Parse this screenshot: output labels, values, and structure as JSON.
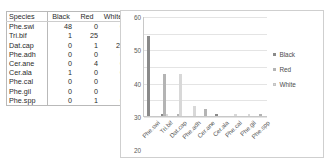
{
  "table": {
    "columns": [
      "Species",
      "Black",
      "Red",
      "White"
    ],
    "rows": [
      {
        "species": "Phe.swi",
        "black": "48",
        "red": "0",
        "white": "0"
      },
      {
        "species": "Tri.bif",
        "black": "1",
        "red": "25",
        "white": "1"
      },
      {
        "species": "Dat.cap",
        "black": "0",
        "red": "1",
        "white": "25"
      },
      {
        "species": "Phe.adh",
        "black": "0",
        "red": "0",
        "white": "6"
      },
      {
        "species": "Cer.ane",
        "black": "0",
        "red": "4",
        "white": "0"
      },
      {
        "species": "Cer.ala",
        "black": "1",
        "red": "0",
        "white": "0"
      },
      {
        "species": "Phe.cal",
        "black": "0",
        "red": "0",
        "white": "1"
      },
      {
        "species": "Phe.gil",
        "black": "0",
        "red": "0",
        "white": "1"
      },
      {
        "species": "Phe.spp",
        "black": "0",
        "red": "1",
        "white": "0"
      }
    ]
  },
  "chart_data": {
    "type": "bar",
    "title": "",
    "xlabel": "",
    "ylabel": "",
    "ylim": [
      0,
      60
    ],
    "yticks": [
      "0",
      "10",
      "20",
      "30",
      "40",
      "50",
      "60"
    ],
    "grid": true,
    "legend_position": "right",
    "categories": [
      "Phe.swi",
      "Tri.bif",
      "Dat.cap",
      "Phe.adh",
      "Cer.ane",
      "Cer.ala",
      "Phe.cal",
      "Phe.gil",
      "Phe.spp"
    ],
    "series": [
      {
        "name": "Black",
        "color": "#8a8a8a",
        "values": [
          48,
          1,
          0,
          0,
          0,
          1,
          0,
          0,
          0
        ]
      },
      {
        "name": "Red",
        "color": "#b4b4b4",
        "values": [
          0,
          25,
          1,
          0,
          4,
          0,
          0,
          0,
          1
        ]
      },
      {
        "name": "White",
        "color": "#d8d8d8",
        "values": [
          0,
          1,
          25,
          6,
          0,
          0,
          1,
          1,
          0
        ]
      }
    ]
  }
}
